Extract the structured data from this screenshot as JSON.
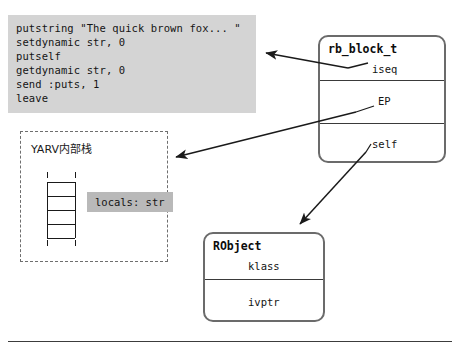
{
  "diagram": {
    "colors": {
      "code_background": "#d4d4d4",
      "chip_background": "#b9b9b9",
      "box_border": "#6b6b6b",
      "dashed_border": "#6e6e6e",
      "text": "#141414",
      "arrow": "#1a1a1a",
      "page_background": "#ffffff"
    }
  },
  "code_block": {
    "name": "bytecode-listing",
    "lines": [
      "putstring \"The quick brown fox... \"",
      "setdynamic str, 0",
      "putself",
      "getdynamic str, 0",
      "send :puts, 1",
      "leave"
    ]
  },
  "yarv_box": {
    "title": "YARV内部栈",
    "locals_label": "locals: str",
    "stack_rungs": 4
  },
  "rb_block_box": {
    "title": "rb_block_t",
    "fields": [
      {
        "label": "iseq"
      },
      {
        "label": "EP"
      },
      {
        "label": "self"
      }
    ]
  },
  "robject_box": {
    "title": "RObject",
    "fields": [
      {
        "label": "klass"
      },
      {
        "label": "ivptr"
      }
    ]
  },
  "arrows": [
    {
      "name": "iseq-to-bytecode",
      "from": "iseq",
      "to": "bytecode-listing"
    },
    {
      "name": "ep-to-yarv-stack",
      "from": "EP",
      "to": "YARV内部栈"
    },
    {
      "name": "self-to-robject",
      "from": "self",
      "to": "RObject"
    }
  ],
  "footer": {
    "rule": true
  }
}
